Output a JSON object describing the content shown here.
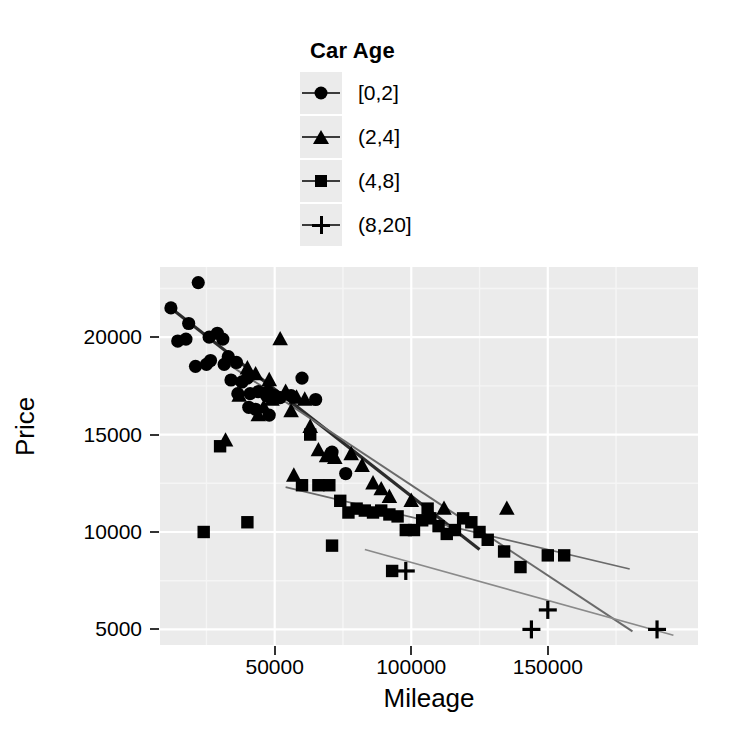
{
  "legend": {
    "title": "Car Age",
    "entries": [
      {
        "label": "[0,2]",
        "symbol": "circle-marker",
        "color": "#000000"
      },
      {
        "label": "(2,4]",
        "symbol": "triangle-marker",
        "color": "#000000"
      },
      {
        "label": "(4,8]",
        "symbol": "square-marker",
        "color": "#000000"
      },
      {
        "label": "(8,20]",
        "symbol": "plus-marker",
        "color": "#000000"
      }
    ]
  },
  "axes": {
    "x_label": "Mileage",
    "y_label": "Price",
    "x_ticks": [
      "50000",
      "100000",
      "150000"
    ],
    "y_ticks": [
      "5000",
      "10000",
      "15000",
      "20000"
    ]
  },
  "chart_data": {
    "type": "scatter",
    "title": "",
    "xlabel": "Mileage",
    "ylabel": "Price",
    "xlim": [
      8000,
      205000
    ],
    "ylim": [
      4200,
      23600
    ],
    "xticks": [
      50000,
      100000,
      150000
    ],
    "yticks": [
      5000,
      10000,
      15000,
      20000
    ],
    "grid": true,
    "grid_major_color": "#ffffff",
    "grid_minor_color": "#f5f5f5",
    "panel_background": "#ebebeb",
    "legend": {
      "title": "Car Age",
      "position": "top"
    },
    "series": [
      {
        "name": "[0,2]",
        "marker": "circle",
        "color": "#000000",
        "points": [
          [
            12000,
            21500
          ],
          [
            14500,
            19800
          ],
          [
            17500,
            19900
          ],
          [
            22000,
            22800
          ],
          [
            18500,
            20700
          ],
          [
            26000,
            20000
          ],
          [
            29000,
            20200
          ],
          [
            31000,
            19900
          ],
          [
            26500,
            18800
          ],
          [
            31500,
            18600
          ],
          [
            33000,
            19000
          ],
          [
            36000,
            18700
          ],
          [
            21000,
            18500
          ],
          [
            25000,
            18600
          ],
          [
            34000,
            17800
          ],
          [
            38000,
            17700
          ],
          [
            40000,
            17900
          ],
          [
            36500,
            17100
          ],
          [
            41000,
            17100
          ],
          [
            44000,
            17200
          ],
          [
            47000,
            17000
          ],
          [
            50000,
            17000
          ],
          [
            52000,
            16900
          ],
          [
            47500,
            17200
          ],
          [
            56000,
            17000
          ],
          [
            60000,
            17900
          ],
          [
            48000,
            16000
          ],
          [
            65000,
            16800
          ],
          [
            71000,
            14100
          ],
          [
            76000,
            13000
          ],
          [
            40500,
            16400
          ],
          [
            43000,
            16300
          ]
        ],
        "fit_line": {
          "x1": 11000,
          "y1": 21600,
          "x2": 125000,
          "y2": 9100
        }
      },
      {
        "name": "(2,4]",
        "marker": "triangle",
        "color": "#000000",
        "points": [
          [
            32000,
            14700
          ],
          [
            52000,
            19900
          ],
          [
            43000,
            18100
          ],
          [
            40000,
            18400
          ],
          [
            37000,
            17000
          ],
          [
            48000,
            17800
          ],
          [
            54000,
            17200
          ],
          [
            49000,
            16800
          ],
          [
            46000,
            16400
          ],
          [
            44000,
            16000
          ],
          [
            58000,
            16900
          ],
          [
            61000,
            16800
          ],
          [
            56000,
            16200
          ],
          [
            63000,
            15400
          ],
          [
            66000,
            14200
          ],
          [
            69000,
            13900
          ],
          [
            72000,
            13800
          ],
          [
            78000,
            14000
          ],
          [
            82000,
            13400
          ],
          [
            86000,
            12500
          ],
          [
            89000,
            12200
          ],
          [
            92000,
            11800
          ],
          [
            100000,
            11600
          ],
          [
            112000,
            11200
          ],
          [
            135000,
            11200
          ],
          [
            57000,
            12900
          ]
        ],
        "fit_line": {
          "x1": 31000,
          "y1": 18800,
          "x2": 181000,
          "y2": 4900
        }
      },
      {
        "name": "(4,8]",
        "marker": "square",
        "color": "#000000",
        "points": [
          [
            30000,
            14400
          ],
          [
            24000,
            10000
          ],
          [
            40000,
            10500
          ],
          [
            63000,
            15000
          ],
          [
            66000,
            12400
          ],
          [
            70000,
            12400
          ],
          [
            74000,
            11600
          ],
          [
            77000,
            11000
          ],
          [
            80000,
            11200
          ],
          [
            83000,
            11100
          ],
          [
            86000,
            11000
          ],
          [
            89000,
            11100
          ],
          [
            92000,
            10900
          ],
          [
            95000,
            10800
          ],
          [
            98000,
            10100
          ],
          [
            101000,
            10100
          ],
          [
            104000,
            10600
          ],
          [
            107000,
            10700
          ],
          [
            110000,
            10300
          ],
          [
            113000,
            9900
          ],
          [
            116000,
            10100
          ],
          [
            119000,
            10700
          ],
          [
            122000,
            10500
          ],
          [
            125000,
            10000
          ],
          [
            93000,
            8000
          ],
          [
            128000,
            9600
          ],
          [
            134000,
            9000
          ],
          [
            140000,
            8200
          ],
          [
            150000,
            8800
          ],
          [
            156000,
            8800
          ],
          [
            71000,
            9300
          ],
          [
            106000,
            11200
          ],
          [
            60000,
            12400
          ]
        ],
        "fit_line": {
          "x1": 54000,
          "y1": 12300,
          "x2": 180000,
          "y2": 8100
        }
      },
      {
        "name": "(8,20]",
        "marker": "plus",
        "color": "#000000",
        "points": [
          [
            98000,
            8000
          ],
          [
            144000,
            5000
          ],
          [
            150000,
            6000
          ],
          [
            190000,
            5000
          ]
        ],
        "fit_line": {
          "x1": 83000,
          "y1": 9100,
          "x2": 196000,
          "y2": 4700
        }
      }
    ]
  }
}
